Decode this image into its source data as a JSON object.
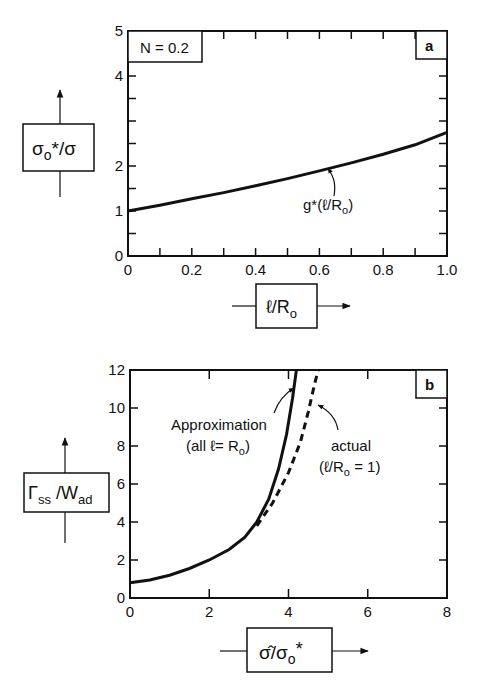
{
  "chart_data": [
    {
      "type": "line",
      "panel_label": "a",
      "annotation_box": "N = 0.2",
      "xlabel": "ℓ/R",
      "xlabel_sub": "o",
      "ylabel": "σ",
      "ylabel_sub": "o",
      "ylabel_rest": "*/σ",
      "x_ticks": [
        "0",
        "0.2",
        "0.4",
        "0.6",
        "0.8",
        "1.0"
      ],
      "y_ticks": [
        "0",
        "1",
        "2",
        "4",
        "5"
      ],
      "xlim": [
        0,
        1.0
      ],
      "ylim": [
        0,
        5
      ],
      "grid": false,
      "series": [
        {
          "name": "g*(ℓ/Ro)",
          "style": "solid",
          "x": [
            0,
            0.1,
            0.2,
            0.3,
            0.4,
            0.5,
            0.6,
            0.7,
            0.8,
            0.9,
            1.0
          ],
          "y": [
            1.0,
            1.13,
            1.27,
            1.41,
            1.56,
            1.72,
            1.89,
            2.07,
            2.26,
            2.47,
            2.75
          ]
        }
      ],
      "curve_label": "g*(ℓ/R",
      "curve_label_sub": "o",
      "curve_label_end": ")"
    },
    {
      "type": "line",
      "panel_label": "b",
      "xlabel": "σ̂/σ",
      "xlabel_sub": "o",
      "xlabel_rest": "*",
      "ylabel": "Γ",
      "ylabel_sub": "ss",
      "ylabel_mid": " /W",
      "ylabel_sub2": "ad",
      "x_ticks": [
        "0",
        "2",
        "4",
        "6",
        "8"
      ],
      "y_ticks": [
        "0",
        "2",
        "4",
        "6",
        "8",
        "10",
        "12"
      ],
      "xlim": [
        0,
        8
      ],
      "ylim": [
        0,
        12
      ],
      "grid": false,
      "series": [
        {
          "name": "Approximation (all ℓ= Ro)",
          "style": "solid",
          "x": [
            0,
            0.5,
            1.0,
            1.5,
            2.0,
            2.5,
            2.9,
            3.2,
            3.5,
            3.75,
            3.95,
            4.1,
            4.2
          ],
          "y": [
            0.8,
            0.95,
            1.2,
            1.55,
            2.0,
            2.55,
            3.2,
            4.0,
            5.2,
            6.8,
            8.6,
            10.5,
            12.3
          ]
        },
        {
          "name": "actual (ℓ/Ro = 1)",
          "style": "dashed",
          "x": [
            3.2,
            3.6,
            4.0,
            4.3,
            4.5,
            4.65,
            4.75
          ],
          "y": [
            3.8,
            5.0,
            6.6,
            8.2,
            9.8,
            11.2,
            12.3
          ]
        }
      ],
      "annotations": {
        "approx_line1": "Approximation",
        "approx_line2_a": "(all ℓ= R",
        "approx_line2_sub": "o",
        "approx_line2_b": ")",
        "actual_line1": "actual",
        "actual_line2_a": "(ℓ/R",
        "actual_line2_sub": "o",
        "actual_line2_b": " = 1)"
      }
    }
  ]
}
